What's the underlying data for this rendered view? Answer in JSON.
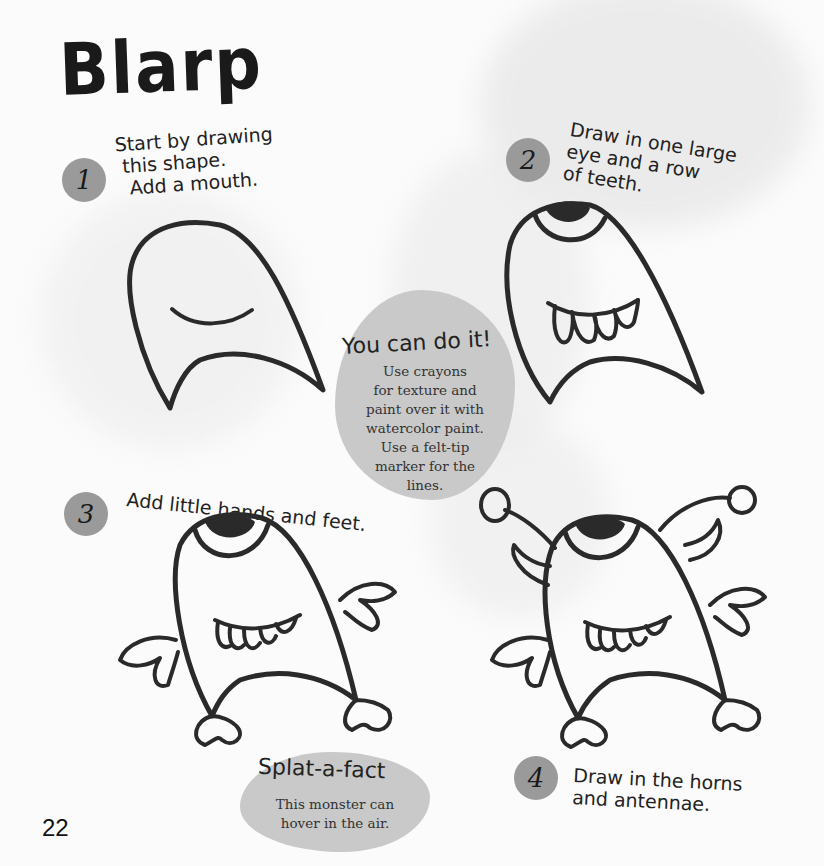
{
  "page": {
    "title": "Blarp",
    "page_number": "22"
  },
  "steps": [
    {
      "number": "1",
      "text": "Start by drawing\n this shape.\n  Add a mouth."
    },
    {
      "number": "2",
      "text": "Draw in one large\neye and a row\nof teeth."
    },
    {
      "number": "3",
      "text": "Add little hands and feet."
    },
    {
      "number": "4",
      "text": "Draw in the horns\nand antennae."
    }
  ],
  "tip": {
    "heading": "You can do it!",
    "body": [
      "Use crayons",
      "for texture and",
      "paint over it with",
      "watercolor paint.",
      "Use a felt-tip",
      "marker for the",
      "lines."
    ]
  },
  "fact": {
    "heading": "Splat-a-fact",
    "body": [
      "This monster can",
      "hover in the air."
    ]
  },
  "colors": {
    "ink": "#2a2a2a",
    "splat": "#9a9a9a",
    "bubble": "#c9c9c9",
    "paper": "#fbfbfb"
  }
}
